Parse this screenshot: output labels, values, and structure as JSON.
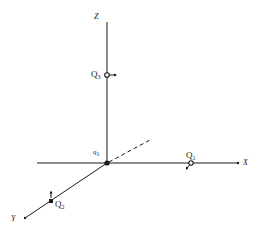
{
  "diagram": {
    "type": "3d-coordinate-axes",
    "colors": {
      "ink": "#1a1a1a",
      "background": "#ffffff"
    },
    "axes": {
      "z": {
        "label": "Z"
      },
      "x": {
        "label": "X"
      },
      "y": {
        "label": "Y"
      }
    },
    "origin": {
      "label_main": "q",
      "label_sub": "1"
    },
    "charges": [
      {
        "id": "Q3",
        "label_main": "Q",
        "label_sub": "3",
        "axis": "z",
        "marker": "open-circle",
        "arrow": "right"
      },
      {
        "id": "Q1",
        "label_main": "Q",
        "label_sub": "1",
        "axis": "x",
        "marker": "open-circle",
        "arrow": "down-left"
      },
      {
        "id": "Q2",
        "label_main": "Q",
        "label_sub": "2",
        "axis": "y",
        "marker": "filled-square",
        "arrow": "up"
      }
    ],
    "dashed_line": {
      "from": "origin",
      "direction": "up-right"
    }
  }
}
